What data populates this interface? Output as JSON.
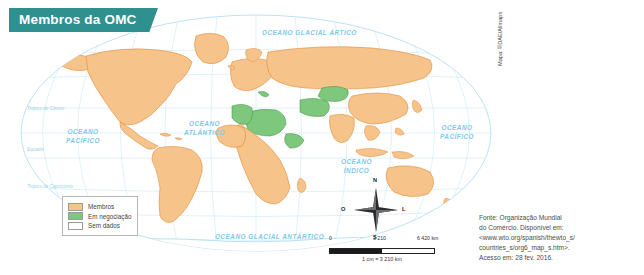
{
  "title": {
    "text": "Membros da OMC"
  },
  "colors": {
    "banner": "#2f9090",
    "members": "#f6c48a",
    "negotiating": "#7dc87d",
    "no_data": "#ffffff",
    "ocean_text": "#7ec8e8",
    "graticule": "#bfe3f2",
    "country_border": "#e08b3a"
  },
  "legend": {
    "items": [
      {
        "label": "Membros",
        "color": "#f6c48a",
        "key": "members"
      },
      {
        "label": "Em negociação",
        "color": "#7dc87d",
        "key": "negotiating"
      },
      {
        "label": "Sem dados",
        "color": "#ffffff",
        "key": "no-data"
      }
    ]
  },
  "ocean_labels": [
    {
      "name": "arctic",
      "lines": "OCEANO GLACIAL ÁRTICO",
      "x": 262,
      "y": 29
    },
    {
      "name": "pacific-west",
      "lines": "OCEANO\nPACÍFICO",
      "x": 66,
      "y": 128
    },
    {
      "name": "atlantic",
      "lines": "OCEANO\nATLÂNTICO",
      "x": 184,
      "y": 120
    },
    {
      "name": "pacific-east",
      "lines": "OCEANO\nPACÍFICO",
      "x": 440,
      "y": 124
    },
    {
      "name": "indian",
      "lines": "OCEANO\nÍNDICO",
      "x": 341,
      "y": 158
    },
    {
      "name": "antarctic",
      "lines": "OCEANO GLACIAL ANTÁRTICO",
      "x": 215,
      "y": 233
    }
  ],
  "latitude_labels": [
    {
      "name": "tropic-cancer",
      "text": "Trópico de Câncer",
      "x": 27,
      "y": 106
    },
    {
      "name": "equator",
      "text": "Equador",
      "x": 27,
      "y": 147
    },
    {
      "name": "tropic-capricorn",
      "text": "Trópico de Capricórnio",
      "x": 27,
      "y": 184
    },
    {
      "name": "antarctic-circle",
      "text": "Círculo Polar Antártico",
      "x": 72,
      "y": 232
    }
  ],
  "compass": {
    "north": "N",
    "south": "S",
    "east": "L",
    "west": "O"
  },
  "scale": {
    "min": "0",
    "mid": "3 210",
    "max": "6 420 km",
    "equivalence": "1 cm = 3 210 km"
  },
  "credit": {
    "vertical": "Mapa: ©DAE/Allmaps"
  },
  "source": {
    "line1": "Fonte: Organização Mundial",
    "line2": "do Comércio. Disponível em:",
    "line3": "<www.wto.org/spanish/thewto_s/",
    "line4": "countries_s/org6_map_s.htm>.",
    "line5": "Acesso em: 28 fev. 2016."
  }
}
